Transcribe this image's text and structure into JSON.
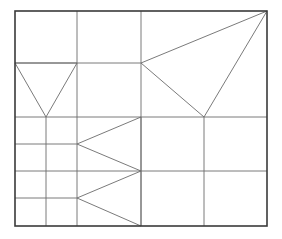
{
  "diagram": {
    "title": "",
    "canvas": {
      "width": 282,
      "height": 239,
      "background": "#ffffff"
    },
    "colors": {
      "line": "#6b6b6b",
      "border": "#3a3a3a"
    },
    "border_rect": {
      "x1": 15,
      "y1": 11,
      "x2": 267,
      "y2": 226
    },
    "lines": [
      {
        "id": "v-77-top",
        "x1": 77,
        "y1": 11,
        "x2": 77,
        "y2": 226
      },
      {
        "id": "v-141",
        "x1": 141,
        "y1": 11,
        "x2": 141,
        "y2": 226
      },
      {
        "id": "v-46",
        "x1": 46,
        "y1": 117,
        "x2": 46,
        "y2": 226
      },
      {
        "id": "v-204",
        "x1": 204,
        "y1": 117,
        "x2": 204,
        "y2": 226
      },
      {
        "id": "h-63",
        "x1": 15,
        "y1": 63,
        "x2": 141,
        "y2": 63
      },
      {
        "id": "h-117",
        "x1": 15,
        "y1": 117,
        "x2": 267,
        "y2": 117
      },
      {
        "id": "h-144",
        "x1": 15,
        "y1": 144,
        "x2": 77,
        "y2": 144
      },
      {
        "id": "h-171",
        "x1": 15,
        "y1": 171,
        "x2": 267,
        "y2": 171
      },
      {
        "id": "h-198",
        "x1": 15,
        "y1": 198,
        "x2": 77,
        "y2": 198
      }
    ],
    "triangles": [
      {
        "id": "v-triangle-left",
        "points": "15,63 77,63 46,117"
      },
      {
        "id": "triangle-right-large",
        "points": "141,63 267,11 204,117"
      },
      {
        "id": "wedge-upper",
        "points": "141,117 77,144 141,171"
      },
      {
        "id": "wedge-lower",
        "points": "141,171 77,198 141,226"
      }
    ]
  }
}
